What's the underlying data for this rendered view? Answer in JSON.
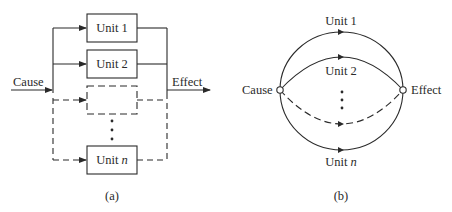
{
  "panel_a": {
    "input_label": "Cause",
    "output_label": "Effect",
    "units": [
      {
        "prefix": "Unit",
        "index": "1",
        "dashed": false
      },
      {
        "prefix": "Unit",
        "index": "2",
        "dashed": false
      },
      {
        "prefix": "",
        "index": "",
        "dashed": true
      },
      {
        "prefix": "Unit",
        "index": "n",
        "dashed": false
      }
    ],
    "caption": "(a)"
  },
  "panel_b": {
    "source_node_label": "Cause",
    "sink_node_label": "Effect",
    "paths": [
      {
        "prefix": "Unit",
        "index": "1"
      },
      {
        "prefix": "Unit",
        "index": "2"
      },
      {
        "prefix": "Unit",
        "index": "n"
      }
    ],
    "caption": "(b)"
  },
  "colors": {
    "stroke": "#2a2a2a",
    "background": "#ffffff"
  }
}
